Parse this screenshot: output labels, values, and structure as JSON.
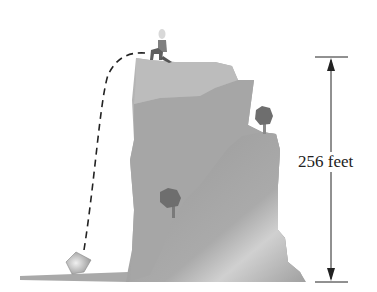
{
  "diagram": {
    "height_label": "256 feet",
    "elements": {
      "cliff": "cliff",
      "person": "person-on-cliff-top",
      "trajectory": "dashed-path",
      "object": "falling-object-at-ground",
      "trees": [
        "tree-upper-right-ledge",
        "tree-middle-left"
      ],
      "dimension": "vertical-double-arrow"
    },
    "colors": {
      "rock_dark": "#8f8f8f",
      "rock_mid": "#a8a8a8",
      "rock_light": "#c4c4c4",
      "tree": "#6e6e6e",
      "line": "#222222"
    }
  }
}
